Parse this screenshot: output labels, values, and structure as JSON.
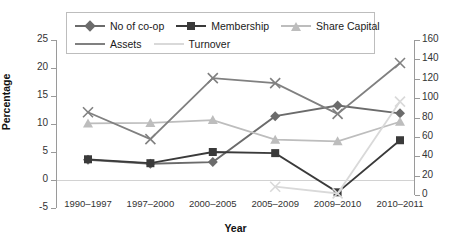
{
  "chart_data": {
    "type": "line",
    "title": "",
    "xlabel": "Year",
    "ylabel": "Percentage",
    "ylabel_right": "",
    "categories": [
      "1990–1997",
      "1997–2000",
      "2000–2005",
      "2005–2009",
      "2009–2010",
      "2010–2011"
    ],
    "ylim": [
      -5,
      25
    ],
    "yticks": [
      -5,
      0,
      5,
      10,
      15,
      20,
      25
    ],
    "ylim_right": [
      0,
      160
    ],
    "yticks_right": [
      0,
      20,
      40,
      60,
      80,
      100,
      120,
      140,
      160
    ],
    "grid": false,
    "legend_position": "top-center",
    "series": [
      {
        "name": "No of co-op",
        "axis": "left",
        "color": "#6b6b6b",
        "marker": "diamond",
        "values": [
          3.6,
          2.9,
          3.2,
          11.4,
          13.3,
          11.9
        ]
      },
      {
        "name": "Membership",
        "axis": "left",
        "color": "#3a3a3a",
        "marker": "square",
        "values": [
          3.7,
          3.0,
          5.0,
          4.8,
          -2.2,
          7.1
        ]
      },
      {
        "name": "Share Capital",
        "axis": "left",
        "color": "#bdbdbd",
        "marker": "triangle",
        "values": [
          10.1,
          10.2,
          10.7,
          7.2,
          6.9,
          10.4
        ]
      },
      {
        "name": "Assets",
        "axis": "left",
        "color": "#808080",
        "marker": "x",
        "values": [
          12.1,
          7.3,
          18.2,
          17.3,
          11.8,
          20.9
        ]
      },
      {
        "name": "Turnover",
        "axis": "left",
        "color": "#d9d9d9",
        "marker": "x",
        "values": [
          null,
          null,
          null,
          -1.2,
          -2.4,
          14.0
        ]
      }
    ]
  }
}
